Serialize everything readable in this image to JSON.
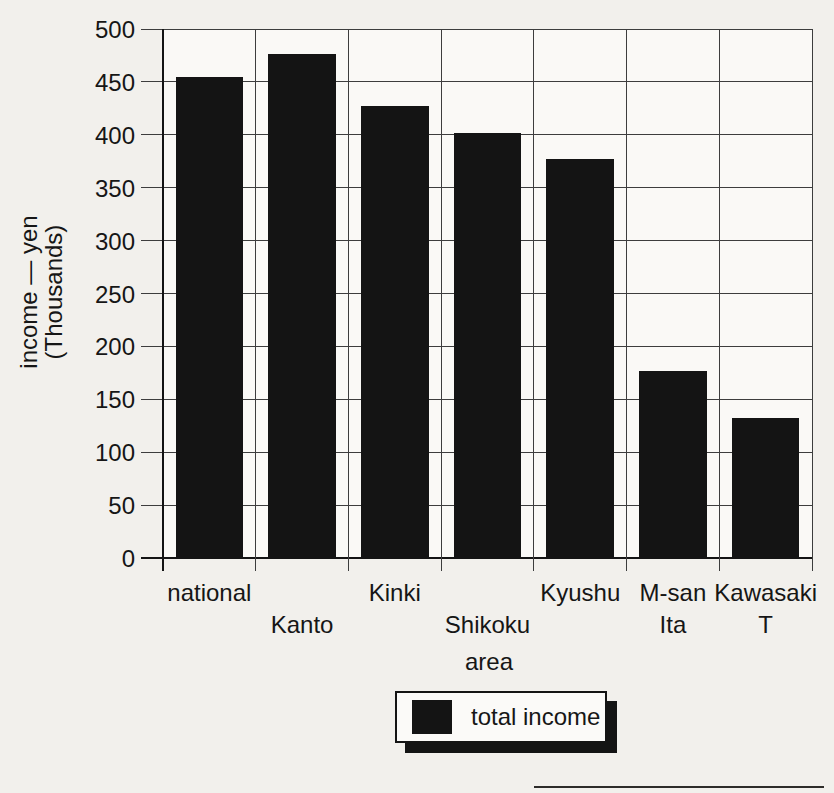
{
  "chart_data": {
    "type": "bar",
    "title": "",
    "categories": [
      "national",
      "Kanto",
      "Kinki",
      "Shikoku",
      "Kyushu",
      "M-san Ita",
      "Kawasaki T"
    ],
    "values": [
      455,
      476,
      427,
      402,
      377,
      177,
      132
    ],
    "series_name": "total income",
    "xlabel": "area",
    "ylabel": "income — yen (Thousands)",
    "ylim": [
      0,
      500
    ],
    "ytick_step": 50,
    "grid": "horizontal gridlines and vertical column separators",
    "legend_position": "bottom-center",
    "bar_color": "#141414"
  },
  "axes": {
    "y_ticks": [
      500,
      450,
      400,
      350,
      300,
      250,
      200,
      150,
      100,
      50,
      0
    ],
    "y_label_line1": "income — yen",
    "y_label_line2": "(Thousands)",
    "x_label": "area"
  },
  "x_categories": [
    {
      "lines": [
        "national"
      ],
      "row": 1
    },
    {
      "lines": [
        "Kanto"
      ],
      "row": 2
    },
    {
      "lines": [
        "Kinki"
      ],
      "row": 1
    },
    {
      "lines": [
        "Shikoku"
      ],
      "row": 2
    },
    {
      "lines": [
        "Kyushu"
      ],
      "row": 1
    },
    {
      "lines": [
        "M-san",
        "Ita"
      ],
      "row": 1
    },
    {
      "lines": [
        "Kawasaki",
        "T"
      ],
      "row": 1
    }
  ],
  "legend": {
    "label": "total income",
    "swatch_color": "#141414"
  },
  "colors": {
    "bar": "#141414",
    "page_background": "#f2f0ec",
    "plot_background": "#faf9f6",
    "gridline": "#3d3d3d",
    "text": "#161616"
  }
}
